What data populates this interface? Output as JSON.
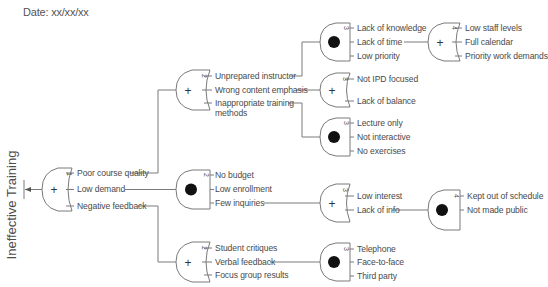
{
  "header": {
    "date": "Date: xx/xx/xx"
  },
  "title": "Ineffective Training",
  "colors": {
    "line": "#7a7a7a",
    "text": "#4a4a4a",
    "dot": "#111111"
  },
  "gates": {
    "root": {
      "type": "OR",
      "level": "1",
      "symbol": "+",
      "inputs": [
        "Poor course quality",
        "Low demand",
        "Negative feedback"
      ]
    },
    "course": {
      "type": "OR",
      "level": "2",
      "symbol": "+",
      "inputs": [
        "Unprepared instructor",
        "Wrong content emphasis",
        "Inappropriate training",
        "methods"
      ]
    },
    "demand": {
      "type": "AND",
      "level": "2",
      "symbol": "●",
      "inputs": [
        "No budget",
        "Low enrollment",
        "Few inquiries"
      ]
    },
    "feedback": {
      "type": "OR",
      "level": "2",
      "symbol": "+",
      "inputs": [
        "Student critiques",
        "Verbal feedback",
        "Focus group results"
      ]
    },
    "instructor": {
      "type": "AND",
      "level": "3",
      "symbol": "●",
      "inputs": [
        "Lack of knowledge",
        "Lack of time",
        "Low priority"
      ]
    },
    "content": {
      "type": "OR",
      "level": "3",
      "symbol": "+",
      "inputs": [
        "Not IPD focused",
        "Lack of balance"
      ]
    },
    "methods": {
      "type": "AND",
      "level": "3",
      "symbol": "●",
      "inputs": [
        "Lecture only",
        "Not interactive",
        "No exercises"
      ]
    },
    "inquiries": {
      "type": "OR",
      "level": "3",
      "symbol": "+",
      "inputs": [
        "Low interest",
        "Lack of info"
      ]
    },
    "verbal": {
      "type": "AND",
      "level": "3",
      "symbol": "●",
      "inputs": [
        "Telephone",
        "Face-to-face",
        "Third party"
      ]
    },
    "time": {
      "type": "OR",
      "level": "4",
      "symbol": "+",
      "inputs": [
        "Low staff levels",
        "Full calendar",
        "Priority work demands"
      ]
    },
    "info": {
      "type": "AND",
      "level": "4",
      "symbol": "●",
      "inputs": [
        "Kept out of schedule",
        "Not made public"
      ]
    }
  }
}
